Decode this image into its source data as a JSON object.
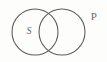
{
  "diagram": {
    "type": "venn-two-set",
    "background_color": "#fdfdfc",
    "stroke_color": "#5c5c5c",
    "label_color": "#6b6b6b",
    "width": 107,
    "height": 62,
    "circles": [
      {
        "id": "set-s",
        "label": "S",
        "cx": 35,
        "cy": 32,
        "r": 23,
        "label_x": 29,
        "label_y": 32,
        "label_position": "inside"
      },
      {
        "id": "set-p",
        "label": "P",
        "cx": 62,
        "cy": 32,
        "r": 23,
        "label_x": 94,
        "label_y": 17,
        "label_position": "outside-top-right"
      }
    ],
    "intersection": {
      "upper_point_x": 48.5,
      "upper_point_y": 12,
      "lower_point_x": 48.5,
      "lower_point_y": 52
    }
  }
}
